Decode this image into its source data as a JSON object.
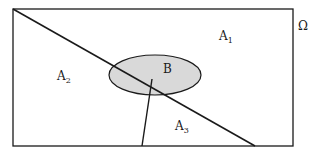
{
  "diagram": {
    "type": "venn-partition",
    "universe": {
      "label": "Ω"
    },
    "regions": [
      {
        "id": "A1",
        "base": "A",
        "sub": "1"
      },
      {
        "id": "A2",
        "base": "A",
        "sub": "2"
      },
      {
        "id": "A3",
        "base": "A",
        "sub": "3"
      }
    ],
    "event": {
      "label": "B",
      "fill": "#d9d9d9"
    },
    "colors": {
      "stroke": "#1a1a1a",
      "background": "#ffffff",
      "ellipse_fill": "#d9d9d9"
    }
  }
}
